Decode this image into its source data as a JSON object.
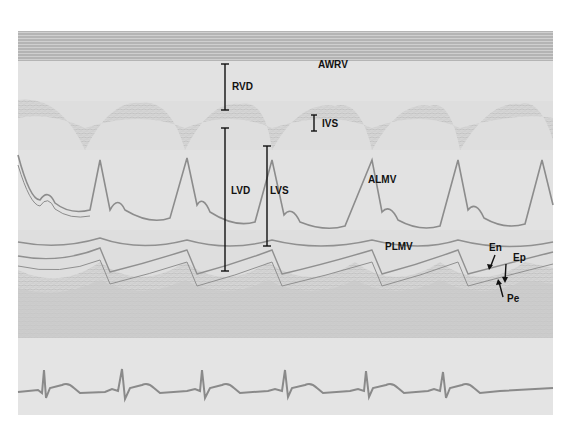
{
  "figure": {
    "type": "M-mode echocardiogram",
    "labels": {
      "awrv": "AWRV",
      "rvd": "RVD",
      "ivs": "IVS",
      "lvd": "LVD",
      "lvs": "LVS",
      "almv": "ALMV",
      "plmv": "PLMV",
      "en": "En",
      "ep": "Ep",
      "pe": "Pe"
    },
    "ecg": {
      "beats_visible": 6
    },
    "colors": {
      "background": "#ffffff",
      "tissue": "#dcdcdc",
      "echo_lines": "#8c8c8c",
      "annotation": "#111111",
      "ecg_trace": "#8a8a8a"
    }
  }
}
